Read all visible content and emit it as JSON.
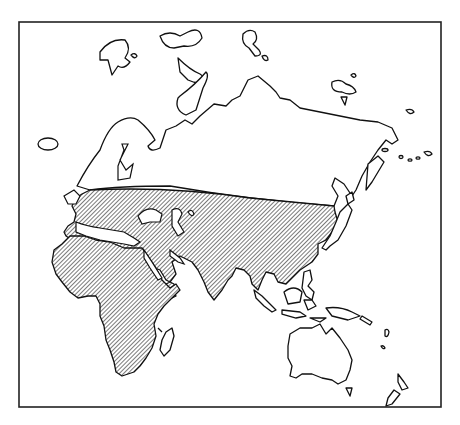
{
  "map": {
    "type": "distribution-map",
    "projection_region": "Eurasia, Africa and Oceania",
    "legend": [],
    "title": "",
    "hatch_pattern": "diagonal-lines",
    "colors": {
      "outline": "#111111",
      "land": "#ffffff",
      "hatch_line": "#333333",
      "background": "#ffffff",
      "frame": "#222222"
    },
    "regions": [
      {
        "name": "Africa",
        "shaded": true
      },
      {
        "name": "Southern Europe",
        "shaded": true
      },
      {
        "name": "Middle East",
        "shaded": true
      },
      {
        "name": "Central Asia",
        "shaded": true
      },
      {
        "name": "South Asia",
        "shaded": true
      },
      {
        "name": "East Asia",
        "shaded": true
      },
      {
        "name": "Southeast Asia (mainland)",
        "shaded": true
      },
      {
        "name": "Northern Europe / Scandinavia",
        "shaded": false
      },
      {
        "name": "Siberia",
        "shaded": false
      },
      {
        "name": "Japan",
        "shaded": false
      },
      {
        "name": "Indonesia / Philippines",
        "shaded": false
      },
      {
        "name": "Australia",
        "shaded": false
      },
      {
        "name": "New Zealand",
        "shaded": false
      },
      {
        "name": "Madagascar",
        "shaded": false
      }
    ]
  }
}
